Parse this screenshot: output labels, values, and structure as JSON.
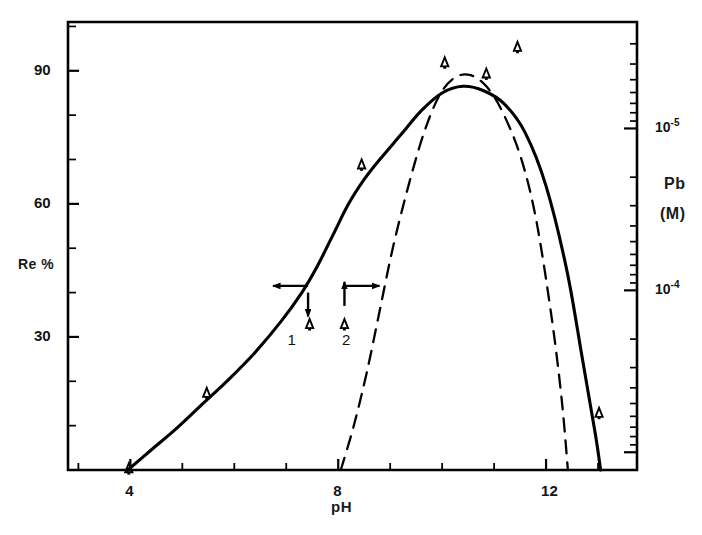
{
  "chart_data": {
    "type": "line",
    "title": "",
    "xlabel": "pH",
    "ylabel": "Re %",
    "y2label": "Pb (M)",
    "xlim": [
      2.8,
      13.75
    ],
    "ylim": [
      0,
      101
    ],
    "grid": false,
    "legend": "inline-curve-numbers",
    "x_ticks": [
      4,
      8,
      12
    ],
    "x_tick_labels": [
      "4",
      "8",
      "12"
    ],
    "x_minor_step": 1,
    "y_ticks": [
      30,
      60,
      90
    ],
    "y_tick_labels": [
      "30",
      "60",
      "90"
    ],
    "y_minor_step": 10,
    "y2_ticks": [
      {
        "label": "10",
        "exponent": "-5",
        "re_value": 77.0
      },
      {
        "label": "10",
        "exponent": "-4",
        "re_value": 40.5
      }
    ],
    "y2_scale": "log",
    "series": [
      {
        "name": "1",
        "label": "1",
        "style": "solid",
        "color": "#000000",
        "points": [
          [
            3.95,
            0.0
          ],
          [
            4.4,
            4.5
          ],
          [
            4.9,
            9.5
          ],
          [
            5.4,
            15.0
          ],
          [
            5.9,
            20.5
          ],
          [
            6.4,
            26.5
          ],
          [
            6.9,
            33.5
          ],
          [
            7.3,
            40.0
          ],
          [
            7.6,
            46.0
          ],
          [
            7.9,
            53.0
          ],
          [
            8.2,
            60.0
          ],
          [
            8.5,
            65.5
          ],
          [
            8.8,
            70.0
          ],
          [
            9.2,
            75.5
          ],
          [
            9.6,
            81.0
          ],
          [
            10.0,
            85.0
          ],
          [
            10.4,
            86.5
          ],
          [
            10.8,
            85.5
          ],
          [
            11.2,
            82.5
          ],
          [
            11.6,
            76.0
          ],
          [
            12.0,
            64.0
          ],
          [
            12.4,
            45.0
          ],
          [
            12.7,
            25.0
          ],
          [
            12.95,
            8.0
          ],
          [
            13.05,
            0.0
          ]
        ],
        "label_position": [
          7.1,
          29.0
        ]
      },
      {
        "name": "2",
        "label": "2",
        "style": "dashed",
        "color": "#000000",
        "points": [
          [
            8.05,
            0.0
          ],
          [
            8.3,
            10.0
          ],
          [
            8.55,
            22.0
          ],
          [
            8.8,
            36.0
          ],
          [
            9.05,
            50.0
          ],
          [
            9.35,
            64.0
          ],
          [
            9.65,
            76.0
          ],
          [
            9.95,
            84.5
          ],
          [
            10.25,
            88.5
          ],
          [
            10.55,
            89.0
          ],
          [
            10.85,
            86.5
          ],
          [
            11.15,
            81.0
          ],
          [
            11.5,
            71.0
          ],
          [
            11.8,
            57.0
          ],
          [
            12.1,
            35.0
          ],
          [
            12.3,
            16.0
          ],
          [
            12.42,
            0.0
          ]
        ],
        "label_position": [
          8.15,
          29.0
        ]
      }
    ],
    "markers": [
      {
        "shape": "triangle",
        "glyph": "delta",
        "x": 3.97,
        "y": 0.5
      },
      {
        "shape": "triangle",
        "glyph": "delta",
        "x": 5.47,
        "y": 17.5
      },
      {
        "shape": "triangle",
        "glyph": "delta",
        "x": 7.45,
        "y": 33.0
      },
      {
        "shape": "triangle",
        "glyph": "delta",
        "x": 8.12,
        "y": 33.0
      },
      {
        "shape": "triangle",
        "glyph": "delta",
        "x": 8.45,
        "y": 69.0
      },
      {
        "shape": "triangle",
        "glyph": "delta",
        "x": 10.05,
        "y": 92.0
      },
      {
        "shape": "triangle",
        "glyph": "delta",
        "x": 10.85,
        "y": 89.5
      },
      {
        "shape": "triangle",
        "glyph": "delta",
        "x": 11.45,
        "y": 95.5
      },
      {
        "shape": "triangle",
        "glyph": "delta",
        "x": 13.02,
        "y": 13.0
      }
    ],
    "annotations": [
      {
        "type": "arrow-left",
        "x": 7.42,
        "y": 41.5,
        "length_px": 35,
        "note": "left-pointing arrow at curve 1"
      },
      {
        "type": "arrow-down",
        "x": 7.42,
        "y": 40.0,
        "length_px": 24,
        "note": "down-pointing arrow at curve 1"
      },
      {
        "type": "arrow-right",
        "x": 8.12,
        "y": 41.5,
        "length_px": 35,
        "note": "right-pointing arrow at curve 2"
      },
      {
        "type": "arrow-up",
        "x": 8.12,
        "y": 37.0,
        "length_px": 24,
        "note": "up-pointing arrow at curve 2"
      }
    ]
  },
  "axes": {
    "y_left_title": "Re %",
    "x_title": "pH",
    "y_right_title_line1": "Pb",
    "y_right_title_line2": "(M)"
  },
  "tick_labels": {
    "x": [
      "4",
      "8",
      "12"
    ],
    "y": [
      "90",
      "60",
      "30"
    ],
    "y_right": [
      "10",
      "10"
    ],
    "y_right_exponents": [
      "-5",
      "-4"
    ]
  },
  "curve_labels": {
    "one": "1",
    "two": "2"
  },
  "colors": {
    "ink": "#000000",
    "background": "#ffffff",
    "text": "#141414"
  }
}
